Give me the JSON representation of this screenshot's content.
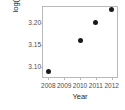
{
  "chart_data": {
    "type": "scatter",
    "title": "",
    "xlabel": "Year",
    "ylabel": "log(Debt)",
    "x": [
      2008,
      2010,
      2011,
      2012
    ],
    "values": [
      3.09,
      3.16,
      3.2,
      3.23
    ],
    "points": [
      {
        "x": 2008,
        "y": 3.09
      },
      {
        "x": 2010,
        "y": 3.16
      },
      {
        "x": 2011,
        "y": 3.2
      },
      {
        "x": 2012,
        "y": 3.23
      }
    ],
    "xlim": [
      2007.6,
      2012.4
    ],
    "ylim": [
      3.075,
      3.238
    ],
    "x_tick_labels": [
      "2008",
      "2009",
      "2010",
      "2011",
      "2012"
    ],
    "x_tick_values": [
      2008,
      2009,
      2010,
      2011,
      2012
    ],
    "y_tick_labels": [
      "3.10",
      "3.15",
      "3.20"
    ],
    "y_tick_values": [
      3.1,
      3.15,
      3.2
    ],
    "grid": false,
    "legend": false,
    "marker": "filled-circle",
    "marker_color": "#1a1a1a",
    "frame_color": "#b9b9b9",
    "background": "#ffffff"
  }
}
